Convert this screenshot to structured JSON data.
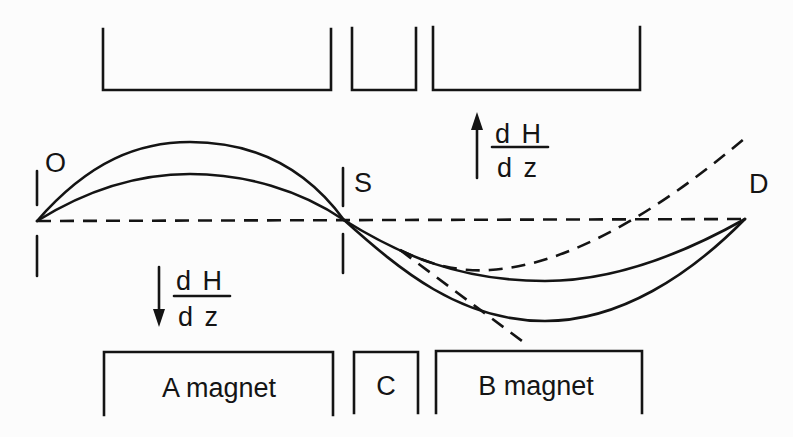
{
  "diagram": {
    "title": "",
    "colors": {
      "background": "#fcfcfc",
      "ink": "#141414"
    },
    "points": {
      "O": {
        "label": "O",
        "x": 37,
        "y": 221
      },
      "S": {
        "label": "S",
        "x": 344,
        "y": 220
      },
      "D": {
        "label": "D",
        "x": 745,
        "y": 219
      }
    },
    "magnets_top": [
      {
        "id": "A",
        "label": "",
        "x1": 103,
        "x2": 331,
        "y_top": 29,
        "y_bottom": 90
      },
      {
        "id": "C",
        "label": "",
        "x1": 352,
        "x2": 416,
        "y_top": 28,
        "y_bottom": 90
      },
      {
        "id": "B",
        "label": "",
        "x1": 433,
        "x2": 640,
        "y_top": 27,
        "y_bottom": 90
      }
    ],
    "magnets_bottom": [
      {
        "id": "A",
        "label": "A magnet",
        "x1": 104,
        "x2": 333,
        "y_top": 352,
        "y_bottom": 415
      },
      {
        "id": "C",
        "label": "C",
        "x1": 354,
        "x2": 418,
        "y_top": 352,
        "y_bottom": 413
      },
      {
        "id": "B",
        "label": "B magnet",
        "x1": 436,
        "x2": 642,
        "y_top": 351,
        "y_bottom": 413
      }
    ],
    "gradients": [
      {
        "id": "grad-up",
        "direction": "up",
        "numerator": "d H",
        "denominator": "d z",
        "arrow_x": 477,
        "arrow_y1": 178,
        "arrow_y2": 114,
        "frac_x": 492,
        "frac_line_y": 147
      },
      {
        "id": "grad-down",
        "direction": "down",
        "numerator": "d H",
        "denominator": "d z",
        "arrow_x": 159,
        "arrow_y1": 267,
        "arrow_y2": 326,
        "frac_x": 174,
        "frac_line_y": 296
      }
    ],
    "trajectories": {
      "axis_dashed": "O-S-D horizontal reference line",
      "solid_upper_arcs": [
        "O→S high arc (peak y≈142)",
        "O→S low arc (peak y≈174)"
      ],
      "solid_lower_arcs": [
        "S→D shallow arc (trough y≈281)",
        "S→D deep arc (trough y≈321)"
      ],
      "dashed_straight": "tangent continuation from S downward to (522,341)",
      "dashed_curve": "deflected path from S through min (~490,270) up to (745,138)"
    }
  }
}
